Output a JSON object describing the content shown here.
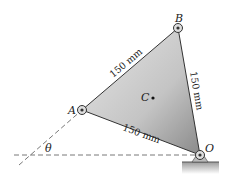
{
  "points": {
    "A": "A",
    "B": "B",
    "C": "C",
    "O": "O"
  },
  "angle": "θ",
  "dimensions": {
    "AB": "150 mm",
    "BO": "150 mm",
    "AO": "150 mm"
  },
  "colors": {
    "plate_light": "#d8d8d8",
    "plate_dark": "#8a8a8a",
    "edge": "#333333"
  }
}
